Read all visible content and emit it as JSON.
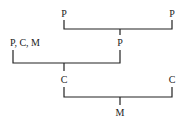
{
  "diagram": {
    "type": "tree",
    "nodes": [
      {
        "id": "top_left",
        "label": "P",
        "x": 64,
        "y": 17
      },
      {
        "id": "top_right",
        "label": "P",
        "x": 172,
        "y": 17
      },
      {
        "id": "mid_right",
        "label": "P",
        "x": 120,
        "y": 46
      },
      {
        "id": "mid_left",
        "label": "P, C, M",
        "x": 13,
        "y": 46
      },
      {
        "id": "low_left",
        "label": "C",
        "x": 64,
        "y": 83
      },
      {
        "id": "low_right",
        "label": "C",
        "x": 172,
        "y": 83
      },
      {
        "id": "bottom",
        "label": "M",
        "x": 120,
        "y": 116
      }
    ],
    "merges": [
      {
        "from": [
          "top_left",
          "top_right"
        ],
        "to": "mid_right"
      },
      {
        "from": [
          "mid_left",
          "mid_right"
        ],
        "to": "low_left"
      },
      {
        "from": [
          "low_left",
          "low_right"
        ],
        "to": "bottom"
      }
    ]
  }
}
